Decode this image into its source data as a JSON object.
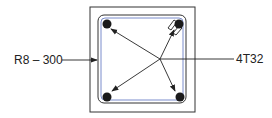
{
  "diagram": {
    "type": "reinforced-concrete-column-section",
    "labels": {
      "stirrup": "R8 – 300",
      "main_bars": "4T32"
    },
    "colors": {
      "line": "#222222",
      "bar": "#1a1a1a",
      "stirrup_tint": "#7a8ccc"
    }
  }
}
